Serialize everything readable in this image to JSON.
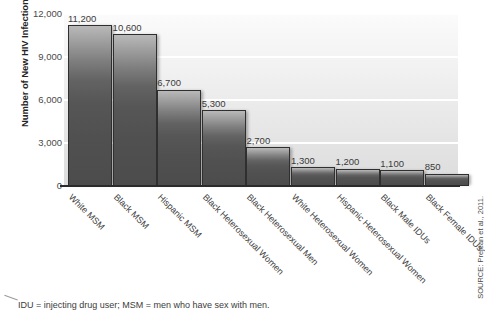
{
  "chart_data": {
    "type": "bar",
    "title": "",
    "xlabel": "",
    "ylabel": "Number of New HIV Infections",
    "ylim": [
      0,
      12000
    ],
    "yticks": [
      "0",
      "3,000",
      "6,000",
      "9,000",
      "12,000"
    ],
    "ytick_values": [
      0,
      3000,
      6000,
      9000,
      12000
    ],
    "grid": "horizontal-white-gridlines",
    "legend": "none",
    "categories": [
      "White MSM",
      "Black MSM",
      "Hispanic MSM",
      "Black Heterosexual Women",
      "Black Heterosexual Men",
      "White Heterosexual Women",
      "Hispanic Heterosexual Women",
      "Black Male IDUs",
      "Black Female IDUs"
    ],
    "values": [
      11200,
      10600,
      6700,
      5300,
      2700,
      1300,
      1200,
      1100,
      850
    ],
    "value_labels": [
      "11,200",
      "10,600",
      "6,700",
      "5,300",
      "2,700",
      "1,300",
      "1,200",
      "1,100",
      "850"
    ],
    "bar_color": "#565656",
    "bar_edge_color": "#2f2f2f",
    "plot_background": "#ececec",
    "gridline_color": "#ffffff"
  },
  "footnote": {
    "text": "IDU = injecting drug user; MSM = men who have sex with men."
  },
  "source": {
    "text": "SOURCE: Prejean et al., 2011."
  }
}
